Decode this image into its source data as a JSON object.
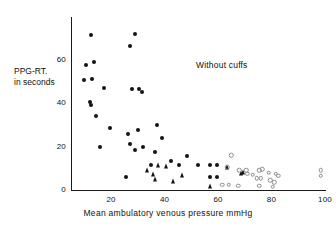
{
  "chart_data": {
    "type": "scatter",
    "title": "",
    "annotation": "Without cuffs",
    "xlabel": "Mean  ambulatory  venous  pressure   mmHg",
    "ylabel_line1": "PPG-RT.",
    "ylabel_line2": "in seconds",
    "xlim": [
      5,
      100
    ],
    "ylim": [
      0,
      73
    ],
    "xticks": [
      20,
      40,
      60,
      80,
      100
    ],
    "yticks": [
      0,
      20,
      40,
      60
    ],
    "grid": false,
    "legend": "none",
    "series": [
      {
        "name": "filled-circle",
        "marker": "filled circle",
        "color": "#141414",
        "points": [
          [
            12.5,
            71.5
          ],
          [
            29.0,
            72.0
          ],
          [
            27.0,
            66.5
          ],
          [
            13.5,
            59.0
          ],
          [
            10.5,
            57.5
          ],
          [
            13.0,
            51.0
          ],
          [
            10.0,
            50.5
          ],
          [
            17.5,
            47.0
          ],
          [
            28.0,
            46.5
          ],
          [
            30.5,
            46.5
          ],
          [
            31.5,
            45.0
          ],
          [
            12.0,
            40.5
          ],
          [
            12.5,
            39.0
          ],
          [
            14.5,
            34.0
          ],
          [
            37.0,
            30.0
          ],
          [
            19.5,
            28.5
          ],
          [
            30.0,
            27.5
          ],
          [
            26.5,
            26.0
          ],
          [
            39.0,
            24.0
          ],
          [
            16.0,
            20.0
          ],
          [
            27.0,
            21.0
          ],
          [
            32.0,
            20.0
          ],
          [
            29.0,
            18.5
          ],
          [
            36.5,
            17.5
          ],
          [
            48.5,
            15.5
          ],
          [
            42.5,
            13.5
          ],
          [
            35.0,
            11.5
          ],
          [
            45.5,
            11.5
          ],
          [
            52.5,
            11.5
          ],
          [
            57.0,
            11.5
          ],
          [
            59.5,
            11.5
          ],
          [
            25.5,
            6.0
          ],
          [
            57.0,
            6.0
          ],
          [
            59.5,
            6.0
          ]
        ]
      },
      {
        "name": "triangle",
        "marker": "filled triangle",
        "color": "#141414",
        "points": [
          [
            37.5,
            11.5
          ],
          [
            40.5,
            11.0
          ],
          [
            33.5,
            9.0
          ],
          [
            35.5,
            7.5
          ],
          [
            46.5,
            7.0
          ],
          [
            36.5,
            5.0
          ],
          [
            43.0,
            4.0
          ],
          [
            57.0,
            2.0
          ],
          [
            68.5,
            8.0
          ],
          [
            69.5,
            8.5
          ],
          [
            63.5,
            10.5
          ]
        ]
      },
      {
        "name": "open-circle",
        "marker": "open circle",
        "color": "#8d8d8d",
        "points": [
          [
            65.0,
            16.0
          ],
          [
            63.5,
            10.5
          ],
          [
            68.0,
            9.0
          ],
          [
            70.5,
            9.0
          ],
          [
            75.5,
            9.0
          ],
          [
            76.5,
            9.5
          ],
          [
            71.0,
            7.5
          ],
          [
            73.0,
            7.0
          ],
          [
            79.0,
            8.0
          ],
          [
            81.5,
            7.5
          ],
          [
            82.5,
            6.5
          ],
          [
            74.5,
            5.5
          ],
          [
            76.0,
            5.5
          ],
          [
            79.5,
            4.5
          ],
          [
            81.0,
            3.5
          ],
          [
            75.5,
            2.0
          ],
          [
            80.5,
            1.5
          ],
          [
            61.5,
            2.5
          ],
          [
            64.0,
            2.5
          ],
          [
            67.5,
            2.0
          ],
          [
            98.5,
            9.0
          ],
          [
            98.5,
            6.5
          ]
        ]
      }
    ]
  },
  "axis_geometry": {
    "x_pixel_min": 71,
    "x_pixel_max": 325,
    "x_value_min": 5,
    "x_value_max": 100,
    "y_pixel_zero": 190,
    "y_pixel_top": 17,
    "y_value_min": 0,
    "y_value_max": 79.7
  }
}
